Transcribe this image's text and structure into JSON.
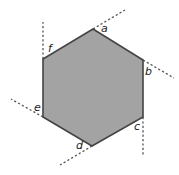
{
  "diagram": {
    "type": "regular-hexagon-exterior-angles",
    "fill_color": "#a3a3a3",
    "stroke_color": "#444444",
    "dash_color": "#555555",
    "vertices": [
      {
        "id": "a",
        "x": 93,
        "y": 29
      },
      {
        "id": "b",
        "x": 143,
        "y": 60
      },
      {
        "id": "c",
        "x": 143,
        "y": 117
      },
      {
        "id": "d",
        "x": 92,
        "y": 146
      },
      {
        "id": "e",
        "x": 43,
        "y": 117
      },
      {
        "id": "f",
        "x": 43,
        "y": 59
      }
    ],
    "extensions": [
      {
        "from": "a",
        "x1": 93,
        "y1": 29,
        "x2": 125,
        "y2": 10
      },
      {
        "from": "b",
        "x1": 143,
        "y1": 60,
        "x2": 174,
        "y2": 78
      },
      {
        "from": "c",
        "x1": 143,
        "y1": 117,
        "x2": 143,
        "y2": 155
      },
      {
        "from": "d",
        "x1": 92,
        "y1": 146,
        "x2": 60,
        "y2": 165
      },
      {
        "from": "e",
        "x1": 43,
        "y1": 117,
        "x2": 11,
        "y2": 99
      },
      {
        "from": "f",
        "x1": 43,
        "y1": 59,
        "x2": 43,
        "y2": 22
      }
    ],
    "labels": [
      {
        "text": "a",
        "x": 101,
        "y": 32
      },
      {
        "text": "b",
        "x": 145,
        "y": 75
      },
      {
        "text": "c",
        "x": 134,
        "y": 130
      },
      {
        "text": "d",
        "x": 76,
        "y": 149
      },
      {
        "text": "e",
        "x": 34,
        "y": 111
      },
      {
        "text": "f",
        "x": 48,
        "y": 52
      }
    ]
  }
}
